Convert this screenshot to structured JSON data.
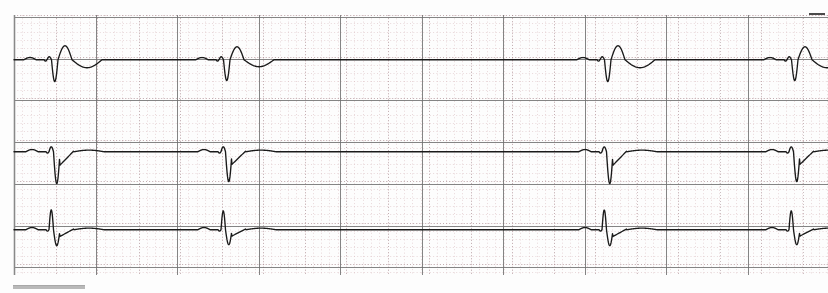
{
  "document": {
    "kind": "ecg-rhythm-strip",
    "title": "ECG Rhythm Strip",
    "channel_count": 3,
    "paper_color": "#fdfdfd",
    "fine_grid_color": "#d8b9bd",
    "major_grid_color": "#6e6e6e",
    "trace_color": "#1a1a1a",
    "calibration_bar_color": "#b9b9b9"
  },
  "grid": {
    "left": 14,
    "right": 828,
    "top": 15,
    "bottom": 275,
    "small_box_px": 8.3,
    "large_box_px": 41.5,
    "major_every": 5,
    "vertical_major_x": [
      14,
      96,
      177,
      259,
      340,
      422,
      503,
      585,
      666,
      748
    ],
    "horizontal_major_y": [
      17,
      59,
      100,
      142,
      184,
      226,
      267
    ]
  },
  "marks": {
    "calibration_bar": {
      "x": 13,
      "y": 285,
      "width": 72,
      "height": 3
    },
    "edge_dash": {
      "x": 809,
      "y": 13,
      "width": 16,
      "height": 2
    }
  },
  "chart_data": {
    "type": "line",
    "subtitle": "Three simultaneous lead channels on standard ECG graph paper",
    "xlabel": "Time",
    "ylabel": "Amplitude",
    "grid": true,
    "legend": "none",
    "x_range_px": [
      14,
      828
    ],
    "paper_speed": "25 mm/s",
    "gain": "10 mm/mV",
    "beat_positions_px": [
      50,
      222,
      603,
      790
    ],
    "rhythm_note": "Irregular — long pause between beat 2 and beat 3",
    "series": [
      {
        "name": "channel-1",
        "baseline_y": 60,
        "top": 17,
        "bottom": 100,
        "morphology": "small r, deep S, prominent R-prime rebound, broad negative T",
        "beats": [
          {
            "x": 50,
            "r": 3,
            "s": 22,
            "rprime": 14,
            "t": -8
          },
          {
            "x": 222,
            "r": 3,
            "s": 21,
            "rprime": 13,
            "t": -7
          },
          {
            "x": 603,
            "r": 3,
            "s": 22,
            "rprime": 14,
            "t": -8
          },
          {
            "x": 790,
            "r": 3,
            "s": 21,
            "rprime": 13,
            "t": -8
          }
        ]
      },
      {
        "name": "channel-2",
        "baseline_y": 152,
        "top": 110,
        "bottom": 196,
        "morphology": "small r, very deep S, slowly rising ST segment to baseline",
        "beats": [
          {
            "x": 52,
            "r": 5,
            "s": 32,
            "rprime": 0,
            "t": 2
          },
          {
            "x": 224,
            "r": 5,
            "s": 30,
            "rprime": 0,
            "t": 2
          },
          {
            "x": 605,
            "r": 5,
            "s": 32,
            "rprime": 0,
            "t": 2
          },
          {
            "x": 792,
            "r": 5,
            "s": 30,
            "rprime": 0,
            "t": 2
          }
        ]
      },
      {
        "name": "channel-3",
        "baseline_y": 230,
        "top": 196,
        "bottom": 272,
        "morphology": "tall narrow R wave, deep S, slow recovery to baseline",
        "beats": [
          {
            "x": 52,
            "r": 20,
            "s": 16,
            "rprime": 0,
            "t": 2
          },
          {
            "x": 224,
            "r": 19,
            "s": 15,
            "rprime": 0,
            "t": 2
          },
          {
            "x": 605,
            "r": 20,
            "s": 16,
            "rprime": 0,
            "t": 2
          },
          {
            "x": 792,
            "r": 19,
            "s": 15,
            "rprime": 0,
            "t": 2
          }
        ]
      }
    ]
  }
}
